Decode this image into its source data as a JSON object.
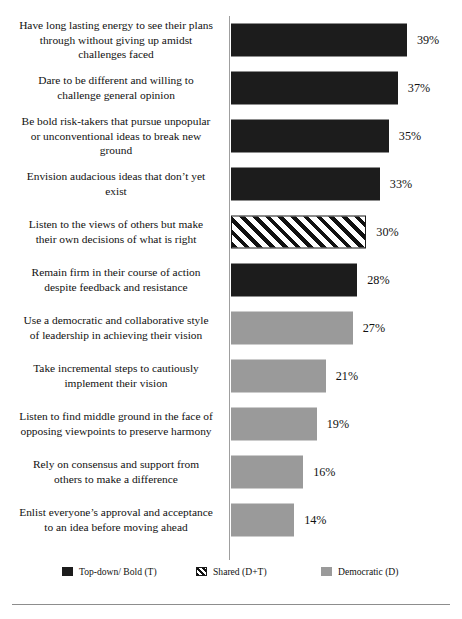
{
  "chart_data": {
    "type": "bar",
    "orientation": "horizontal",
    "title": "",
    "xlabel": "",
    "ylabel": "",
    "grid": false,
    "xlim": [
      0,
      39
    ],
    "legend_position": "bottom",
    "categories": [
      "Have long lasting energy to see their plans through without giving up amidst challenges faced",
      "Dare to be different and willing to challenge  general opinion",
      "Be bold risk-takers  that pursue unpopular or unconventional ideas to break new ground",
      "Envision audacious ideas that don’t  yet exist",
      "Listen to the views of others but make their own decisions of what is right",
      "Remain firm in their course of action despite feedback and resistance",
      "Use a democratic and collaborative style of leadership  in achieving their vision",
      "Take incremental steps to cautiously implement their vision",
      "Listen to find middle ground in the face of opposing viewpoints  to preserve harmony",
      "Rely on consensus and support from others to make a difference",
      "Enlist everyone’s approval and acceptance to an idea before moving ahead"
    ],
    "values": [
      39,
      37,
      35,
      33,
      30,
      28,
      27,
      21,
      19,
      16,
      14
    ],
    "value_labels": [
      "39%",
      "37%",
      "35%",
      "33%",
      "30%",
      "28%",
      "27%",
      "21%",
      "19%",
      "16%",
      "14%"
    ],
    "groups": [
      "topdown",
      "topdown",
      "topdown",
      "topdown",
      "shared",
      "topdown",
      "democratic",
      "democratic",
      "democratic",
      "democratic",
      "democratic"
    ],
    "series": [
      {
        "name": "Top-down/ Bold (T)",
        "key": "topdown",
        "color": "#1c1c1c",
        "values": [
          39,
          37,
          35,
          33,
          null,
          28,
          null,
          null,
          null,
          null,
          null
        ]
      },
      {
        "name": "Shared (D+T)",
        "key": "shared",
        "color": "#ffffff",
        "pattern": "diagonal-hatch",
        "values": [
          null,
          null,
          null,
          null,
          30,
          null,
          null,
          null,
          null,
          null,
          null
        ]
      },
      {
        "name": "Democratic (D)",
        "key": "democratic",
        "color": "#9a9a9a",
        "values": [
          null,
          null,
          null,
          null,
          null,
          null,
          27,
          21,
          19,
          16,
          14
        ]
      }
    ]
  },
  "rows": [
    {
      "label": "Have long lasting energy to see their plans\nthrough without giving up amidst\nchallenges faced",
      "value": 39,
      "value_label": "39%",
      "group": "topdown"
    },
    {
      "label": "Dare to be different and willing to\nchallenge  general opinion",
      "value": 37,
      "value_label": "37%",
      "group": "topdown"
    },
    {
      "label": "Be bold risk-takers  that pursue unpopular\nor unconventional ideas to break new\nground",
      "value": 35,
      "value_label": "35%",
      "group": "topdown"
    },
    {
      "label": "Envision audacious ideas that don’t  yet\nexist",
      "value": 33,
      "value_label": "33%",
      "group": "topdown"
    },
    {
      "label": "Listen to the views of others but make\ntheir own decisions of what is right",
      "value": 30,
      "value_label": "30%",
      "group": "shared"
    },
    {
      "label": "Remain firm in their course of action\ndespite feedback and resistance",
      "value": 28,
      "value_label": "28%",
      "group": "topdown"
    },
    {
      "label": "Use a democratic and collaborative style\nof leadership  in achieving their vision",
      "value": 27,
      "value_label": "27%",
      "group": "democratic"
    },
    {
      "label": "Take incremental steps to cautiously\nimplement their vision",
      "value": 21,
      "value_label": "21%",
      "group": "democratic"
    },
    {
      "label": "Listen to find middle ground in the face of\nopposing viewpoints  to preserve harmony",
      "value": 19,
      "value_label": "19%",
      "group": "democratic"
    },
    {
      "label": "Rely on consensus and support from\nothers to make a difference",
      "value": 16,
      "value_label": "16%",
      "group": "democratic"
    },
    {
      "label": "Enlist everyone’s approval and acceptance\nto an idea before moving ahead",
      "value": 14,
      "value_label": "14%",
      "group": "democratic"
    }
  ],
  "legend": {
    "items": [
      {
        "label": "Top-down/ Bold (T)",
        "key": "topdown",
        "color": "#1c1c1c"
      },
      {
        "label": "Shared (D+T)",
        "key": "shared",
        "color": "#ffffff"
      },
      {
        "label": "Democratic (D)",
        "key": "democratic",
        "color": "#9a9a9a"
      }
    ]
  },
  "render": {
    "px_per_percent": 4.51,
    "bar_origin_x": 231
  }
}
